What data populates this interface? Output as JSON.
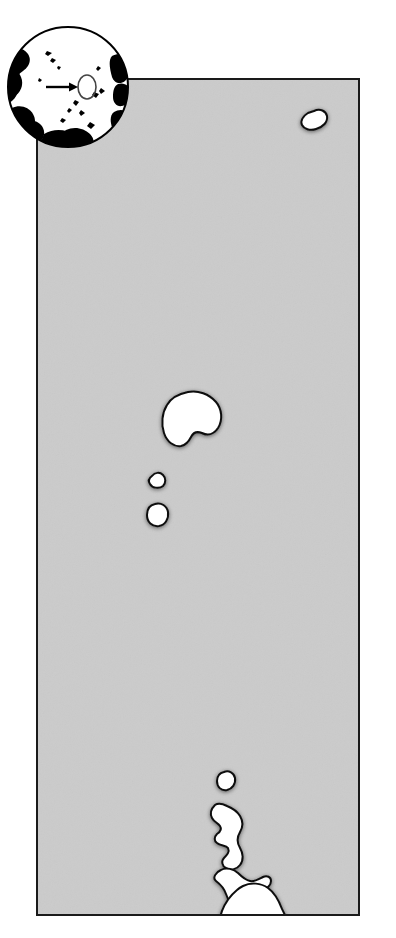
{
  "figure": {
    "kind": "locator-map",
    "title": "",
    "caption": "",
    "width_px": 396,
    "height_px": 938
  },
  "colors": {
    "page_background": "#ffffff",
    "ocean_fill": "#cbcbcb",
    "land_fill": "#ffffff",
    "coastline_stroke": "#111111",
    "frame_stroke": "#1a1a1a",
    "globe_land_fill": "#000000",
    "globe_ocean_fill": "#ffffff",
    "globe_outline": "#000000",
    "pointer_color": "#000000"
  },
  "map_panel": {
    "name": "main-map-frame",
    "left_px": 36,
    "top_px": 78,
    "width_px": 324,
    "height_px": 838,
    "border_width_px": 2,
    "graticule": false,
    "scale_bar": false,
    "north_arrow": false,
    "labels": []
  },
  "globe_inset": {
    "name": "globe-locator-inset",
    "left_px": 6,
    "top_px": 22,
    "diameter_px": 124,
    "projection": "orthographic",
    "center_view": "pacific-ocean",
    "pointer": {
      "type": "arrow",
      "label": "",
      "target_marker": "ellipse",
      "description": "arrow pointing right to small ellipse marking the mapped island group"
    }
  },
  "islands": [
    {
      "id": "island-north",
      "name": "northern-island",
      "label": "",
      "cx_pct": 84.0,
      "cy_pct": 4.6,
      "size": "small",
      "shape": "teardrop"
    },
    {
      "id": "island-central-main",
      "name": "central-main-island",
      "label": "",
      "cx_pct": 44.0,
      "cy_pct": 41.0,
      "size": "medium",
      "shape": "kidney"
    },
    {
      "id": "island-central-upper-islet",
      "name": "central-upper-islet",
      "label": "",
      "cx_pct": 39.0,
      "cy_pct": 48.4,
      "size": "tiny",
      "shape": "triangular"
    },
    {
      "id": "island-central-lower-islet",
      "name": "central-lower-islet",
      "label": "",
      "cx_pct": 39.5,
      "cy_pct": 52.3,
      "size": "tiny",
      "shape": "oval"
    },
    {
      "id": "island-south-islet",
      "name": "southern-outlier-islet",
      "label": "",
      "cx_pct": 59.5,
      "cy_pct": 84.0,
      "size": "tiny",
      "shape": "oval"
    },
    {
      "id": "island-south-archipelago",
      "name": "southern-archipelago",
      "label": "",
      "cx_pct": 62.0,
      "cy_pct": 92.0,
      "size": "large",
      "shape": "irregular-elongated-chain"
    }
  ],
  "annotations": {
    "legend": null,
    "credits": "",
    "notes": ""
  }
}
